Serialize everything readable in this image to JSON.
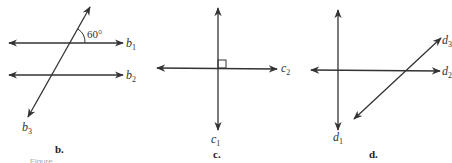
{
  "figures": [
    {
      "id": "b",
      "caption": "b.",
      "lines": [
        {
          "name": "b",
          "sub": "1"
        },
        {
          "name": "b",
          "sub": "2"
        },
        {
          "name": "b",
          "sub": "3"
        }
      ],
      "angle_label": "60°"
    },
    {
      "id": "c",
      "caption": "c.",
      "lines": [
        {
          "name": "c",
          "sub": "1"
        },
        {
          "name": "c",
          "sub": "2"
        }
      ],
      "right_angle_marker": true
    },
    {
      "id": "d",
      "caption": "d.",
      "lines": [
        {
          "name": "d",
          "sub": "1"
        },
        {
          "name": "d",
          "sub": "2"
        },
        {
          "name": "d",
          "sub": "3"
        }
      ]
    }
  ],
  "truncated_caption": "Figure"
}
